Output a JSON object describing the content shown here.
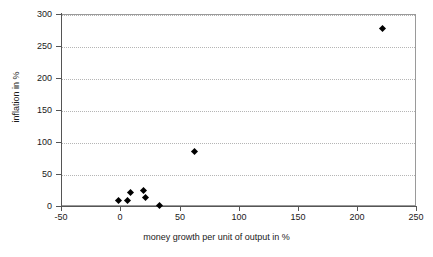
{
  "chart_data": {
    "type": "scatter",
    "title": "",
    "xlabel": "money growth per unit of output in %",
    "ylabel": "inflation in %",
    "xlim": [
      -50,
      250
    ],
    "ylim": [
      0,
      300
    ],
    "xticks": [
      -50,
      0,
      50,
      100,
      150,
      200,
      250
    ],
    "yticks": [
      0,
      50,
      100,
      150,
      200,
      250,
      300
    ],
    "xtick_labels": [
      "-50",
      "0",
      "50",
      "100",
      "150",
      "200",
      "250"
    ],
    "ytick_labels": [
      "0",
      "50",
      "100",
      "150",
      "200",
      "250",
      "300"
    ],
    "grid": "horizontal-dotted",
    "legend": "none",
    "marker": "diamond",
    "marker_color": "#000000",
    "points": [
      {
        "x": -1,
        "y": 9
      },
      {
        "x": 6,
        "y": 9
      },
      {
        "x": 9,
        "y": 21
      },
      {
        "x": 20,
        "y": 25
      },
      {
        "x": 21,
        "y": 14
      },
      {
        "x": 33,
        "y": 1
      },
      {
        "x": 63,
        "y": 85
      },
      {
        "x": 222,
        "y": 278
      }
    ]
  }
}
